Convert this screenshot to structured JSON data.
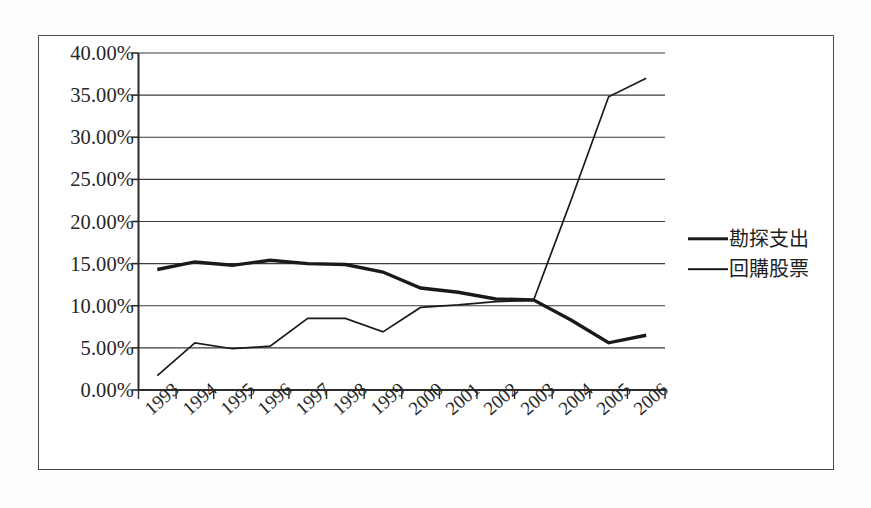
{
  "chart_data": {
    "type": "line",
    "title": "",
    "xlabel": "",
    "ylabel": "",
    "categories": [
      "1993",
      "1994",
      "1995",
      "1996",
      "1997",
      "1998",
      "1999",
      "2000",
      "2001",
      "2002",
      "2003",
      "2004",
      "2005",
      "2006"
    ],
    "ylim": [
      0,
      40
    ],
    "ytick_labels": [
      "0.00%",
      "5.00%",
      "10.00%",
      "15.00%",
      "20.00%",
      "25.00%",
      "30.00%",
      "35.00%",
      "40.00%"
    ],
    "ytick_values": [
      0,
      5,
      10,
      15,
      20,
      25,
      30,
      35,
      40
    ],
    "grid": true,
    "legend_position": "right",
    "series": [
      {
        "name": "勘探支出",
        "style": "thick",
        "color": "#1a1a1a",
        "values": [
          14.3,
          15.2,
          14.8,
          15.4,
          15.0,
          14.9,
          14.0,
          12.1,
          11.6,
          10.8,
          10.7,
          8.3,
          5.6,
          6.5
        ]
      },
      {
        "name": "回購股票",
        "style": "thin",
        "color": "#1a1a1a",
        "values": [
          1.7,
          5.6,
          4.9,
          5.2,
          8.5,
          8.5,
          6.9,
          9.8,
          10.1,
          10.5,
          10.6,
          22.5,
          34.8,
          37.0
        ]
      }
    ]
  },
  "legend": {
    "items": [
      {
        "label": "勘探支出",
        "style": "thick"
      },
      {
        "label": "回購股票",
        "style": "thin"
      }
    ]
  }
}
